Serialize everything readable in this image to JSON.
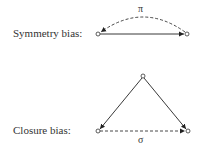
{
  "symmetry": {
    "label": "Symmetry bias:",
    "edge_label": "π"
  },
  "closure": {
    "label": "Closure bias:",
    "edge_label": "σ"
  }
}
